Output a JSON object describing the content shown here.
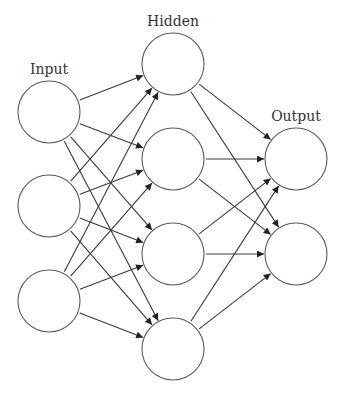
{
  "diagram": {
    "type": "feed-forward-neural-network",
    "layers": [
      {
        "id": "input",
        "label": "Input",
        "nodes": 3
      },
      {
        "id": "hidden",
        "label": "Hidden",
        "nodes": 4
      },
      {
        "id": "output",
        "label": "Output",
        "nodes": 2
      }
    ],
    "connectivity": "fully-connected between adjacent layers, arrows pointing forward"
  },
  "labels": {
    "input": "Input",
    "hidden": "Hidden",
    "output": "Output"
  },
  "colors": {
    "stroke": "#5a5a5a",
    "arrow": "#3a3a3a",
    "background": "#ffffff"
  }
}
